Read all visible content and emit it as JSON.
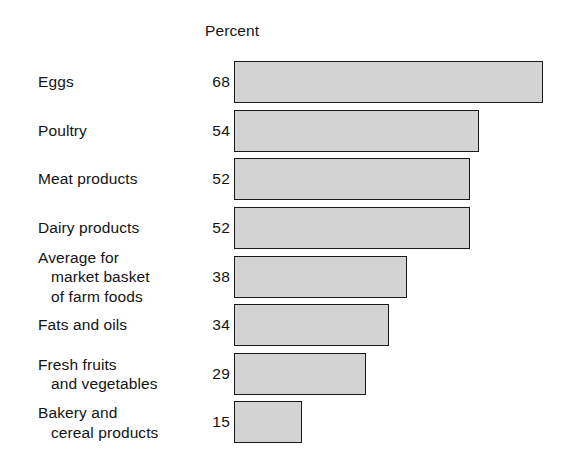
{
  "chart_data": {
    "type": "bar",
    "orientation": "horizontal",
    "title": "",
    "subtitle": "",
    "xlabel": "",
    "ylabel": "",
    "value_axis_header": "Percent",
    "grid": false,
    "legend": null,
    "xlim": [
      0,
      68
    ],
    "value_suffix": "",
    "categories": [
      "Eggs",
      "Poultry",
      "Meat products",
      "Dairy products",
      "Average for market basket of farm foods",
      "Fats and oils",
      "Fresh fruits and vegetables",
      "Bakery and cereal products"
    ],
    "values": [
      68,
      54,
      52,
      52,
      38,
      34,
      29,
      15
    ],
    "series": [
      {
        "name": "Percent",
        "values": [
          68,
          54,
          52,
          52,
          38,
          34,
          29,
          15
        ]
      }
    ],
    "bars": [
      {
        "label_lines": [
          "Eggs"
        ],
        "value": 68,
        "value_text": "68"
      },
      {
        "label_lines": [
          "Poultry"
        ],
        "value": 54,
        "value_text": "54"
      },
      {
        "label_lines": [
          "Meat products"
        ],
        "value": 52,
        "value_text": "52"
      },
      {
        "label_lines": [
          "Dairy products"
        ],
        "value": 52,
        "value_text": "52"
      },
      {
        "label_lines": [
          "Average for",
          "market basket",
          "of farm foods"
        ],
        "value": 38,
        "value_text": "38"
      },
      {
        "label_lines": [
          "Fats and oils"
        ],
        "value": 34,
        "value_text": "34"
      },
      {
        "label_lines": [
          "Fresh fruits",
          "and vegetables"
        ],
        "value": 29,
        "value_text": "29"
      },
      {
        "label_lines": [
          "Bakery and",
          "cereal products"
        ],
        "value": 15,
        "value_text": "15"
      }
    ]
  },
  "style": {
    "background": "#ffffff",
    "text_color": "#131313",
    "bar_fill": "#cfcfcf",
    "bar_pattern": "stipple-dot",
    "bar_border": "#1a1a1a"
  }
}
